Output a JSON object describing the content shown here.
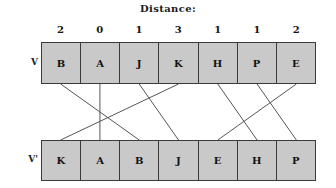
{
  "figure": {
    "title": "Distance:",
    "background_color": "#ffffff",
    "box_fill_color": "#c9c9c9",
    "line_color": "#555555",
    "border_color": "#3a3a3a"
  },
  "distances": {
    "label": "Distance:",
    "values": [
      2,
      0,
      1,
      3,
      1,
      1,
      2
    ]
  },
  "rows": [
    {
      "label": "V",
      "name": "original-sequence",
      "cells": [
        "B",
        "A",
        "J",
        "K",
        "H",
        "P",
        "E"
      ]
    },
    {
      "label": "V'",
      "name": "permuted-sequence",
      "cells": [
        "K",
        "A",
        "B",
        "J",
        "E",
        "H",
        "P"
      ]
    }
  ],
  "chart_data": {
    "type": "diagram",
    "title": "Distance:",
    "categories": [
      "0",
      "1",
      "2",
      "3",
      "4",
      "5",
      "6"
    ],
    "series": [
      {
        "name": "V",
        "values": [
          "B",
          "A",
          "J",
          "K",
          "H",
          "P",
          "E"
        ]
      },
      {
        "name": "V'",
        "values": [
          "K",
          "A",
          "B",
          "J",
          "E",
          "H",
          "P"
        ]
      },
      {
        "name": "Distance",
        "values": [
          2,
          0,
          1,
          3,
          1,
          1,
          2
        ]
      }
    ],
    "edges": [
      {
        "label": "B",
        "from_index": 0,
        "to_index": 2,
        "distance": 2
      },
      {
        "label": "A",
        "from_index": 1,
        "to_index": 1,
        "distance": 0
      },
      {
        "label": "J",
        "from_index": 2,
        "to_index": 3,
        "distance": 1
      },
      {
        "label": "K",
        "from_index": 3,
        "to_index": 0,
        "distance": 3
      },
      {
        "label": "H",
        "from_index": 4,
        "to_index": 5,
        "distance": 1
      },
      {
        "label": "P",
        "from_index": 5,
        "to_index": 6,
        "distance": 1
      },
      {
        "label": "E",
        "from_index": 6,
        "to_index": 4,
        "distance": 2
      }
    ],
    "xlabel": "",
    "ylabel": "",
    "grid": false,
    "legend": "none"
  }
}
